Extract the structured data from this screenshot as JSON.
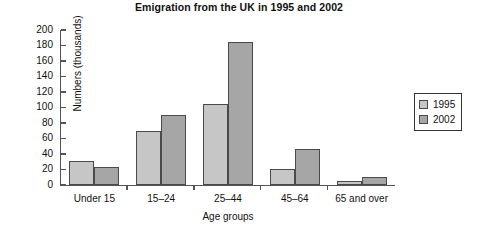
{
  "chart_data": {
    "type": "bar",
    "title": "Emigration from the UK in 1995 and 2002",
    "xlabel": "Age groups",
    "ylabel": "Numbers (thousands)",
    "categories": [
      "Under 15",
      "15–24",
      "25–44",
      "45–64",
      "65 and over"
    ],
    "series": [
      {
        "name": "1995",
        "color": "#c6c6c6",
        "values": [
          31,
          70,
          105,
          21,
          5
        ]
      },
      {
        "name": "2002",
        "color": "#a6a6a6",
        "values": [
          23,
          90,
          185,
          46,
          10
        ]
      }
    ],
    "ylim": [
      0,
      200
    ],
    "ytick_step": 20,
    "yticks": [
      0,
      20,
      40,
      60,
      80,
      100,
      120,
      140,
      160,
      180,
      200
    ],
    "grid": false,
    "legend_position": "right"
  }
}
